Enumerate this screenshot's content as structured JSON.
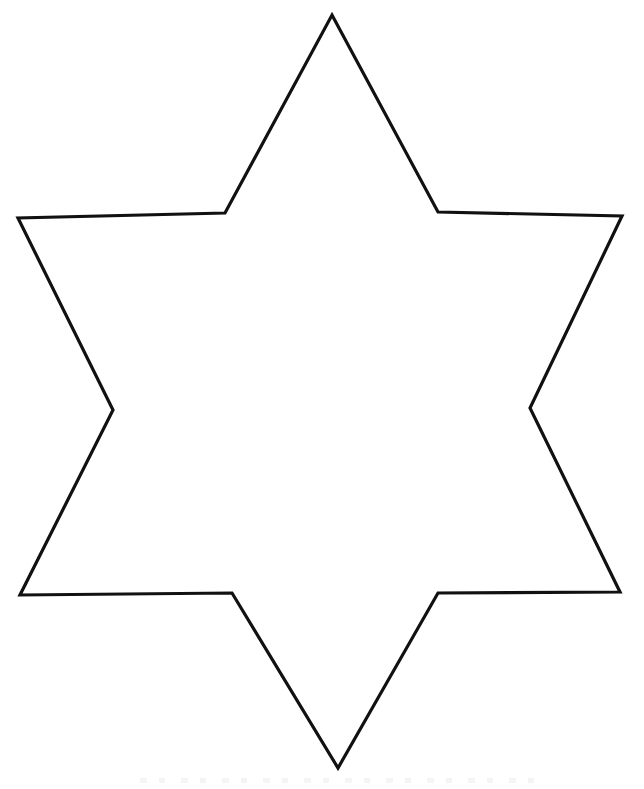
{
  "page": {
    "kind": "line-art-template",
    "width": 644,
    "height": 789,
    "background_color": "#ffffff"
  },
  "artwork": {
    "name": "six-pointed-star",
    "description": "Hand-drawn six-pointed star (hexagram) outline on a plain white page, coloring-template style",
    "point_count": 6,
    "stroke_color": "#111111",
    "fill_color": "#ffffff",
    "stroke_width": 3.2,
    "closed": true,
    "outer_points": [
      {
        "label": "top",
        "x": 332,
        "y": 15
      },
      {
        "label": "upper-right",
        "x": 622,
        "y": 216
      },
      {
        "label": "lower-right",
        "x": 620,
        "y": 592
      },
      {
        "label": "bottom",
        "x": 338,
        "y": 768
      },
      {
        "label": "lower-left",
        "x": 20,
        "y": 595
      },
      {
        "label": "upper-left",
        "x": 18,
        "y": 218
      }
    ],
    "inner_points": [
      {
        "label": "inner-top-right",
        "x": 438,
        "y": 212
      },
      {
        "label": "inner-right",
        "x": 530,
        "y": 408
      },
      {
        "label": "inner-bottom-right",
        "x": 438,
        "y": 593
      },
      {
        "label": "inner-bottom-left",
        "x": 232,
        "y": 593
      },
      {
        "label": "inner-left",
        "x": 113,
        "y": 410
      },
      {
        "label": "inner-top-left",
        "x": 225,
        "y": 213
      }
    ],
    "path_d": "M 332 15 L 438 212 L 622 216 L 530 408 L 620 592 L 438 593 L 338 768 L 232 593 L 20 595 L 113 410 L 18 218 L 225 213 Z"
  },
  "artifacts": {
    "scan_smudge_label": "faint scanner smudge"
  }
}
